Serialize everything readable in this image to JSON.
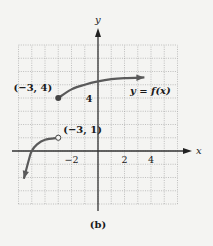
{
  "figure": {
    "caption": "(b)",
    "colors": {
      "background": "#f4f4f2",
      "grid": "#9a9a9a",
      "axis": "#333333",
      "curve": "#5a5a5a",
      "text": "#1a1a1a"
    }
  },
  "chart_data": {
    "type": "line",
    "title": "",
    "function_label": "y = f(x)",
    "xlabel": "x",
    "ylabel": "y",
    "xlim": [
      -6,
      6
    ],
    "ylim": [
      -4,
      8
    ],
    "grid": true,
    "grid_step": 1,
    "x_tick_labels": [
      {
        "value": -2,
        "label": "−2"
      },
      {
        "value": 2,
        "label": "2"
      },
      {
        "value": 4,
        "label": "4"
      }
    ],
    "y_tick_labels": [
      {
        "value": 4,
        "label": "4"
      }
    ],
    "series": [
      {
        "name": "left branch (x < -3)",
        "points": [
          [
            -5.6,
            -2.1
          ],
          [
            -5.2,
            -0.6
          ],
          [
            -5.0,
            0
          ],
          [
            -4.6,
            0.5
          ],
          [
            -4.0,
            0.85
          ],
          [
            -3.0,
            1.0
          ]
        ],
        "start_arrow": true,
        "end_marker": "open-circle"
      },
      {
        "name": "right branch (x >= -3)",
        "points": [
          [
            -3.0,
            4.0
          ],
          [
            -2.0,
            4.65
          ],
          [
            -1.0,
            5.0
          ],
          [
            0.0,
            5.25
          ],
          [
            1.0,
            5.42
          ],
          [
            2.0,
            5.5
          ],
          [
            3.5,
            5.55
          ]
        ],
        "start_marker": "closed-dot",
        "end_arrow": true
      }
    ],
    "annotations": [
      {
        "text": "(−3, 4)",
        "point": [
          -3,
          4
        ],
        "marker": "closed-dot"
      },
      {
        "text": "(−3, 1)",
        "point": [
          -3,
          1
        ],
        "marker": "open-circle"
      },
      {
        "text": "y = f(x)",
        "anchor": [
          3.5,
          4
        ]
      }
    ]
  }
}
